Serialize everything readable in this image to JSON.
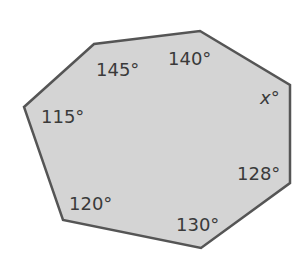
{
  "figure": {
    "shape": "heptagon",
    "fill_color": "#d4d4d4",
    "stroke_color": "#555555",
    "vertices": [
      [
        24,
        107
      ],
      [
        94,
        44
      ],
      [
        200,
        31
      ],
      [
        290,
        85
      ],
      [
        290,
        183
      ],
      [
        201,
        248
      ],
      [
        63,
        220
      ]
    ],
    "angles": [
      {
        "label": "115°",
        "x": 41,
        "y": 123
      },
      {
        "label": "145°",
        "x": 96,
        "y": 76
      },
      {
        "label": "140°",
        "x": 168,
        "y": 65
      },
      {
        "label": "x°",
        "x": 260,
        "y": 104,
        "italic": true
      },
      {
        "label": "128°",
        "x": 237,
        "y": 180
      },
      {
        "label": "130°",
        "x": 176,
        "y": 231
      },
      {
        "label": "120°",
        "x": 69,
        "y": 210
      }
    ]
  }
}
